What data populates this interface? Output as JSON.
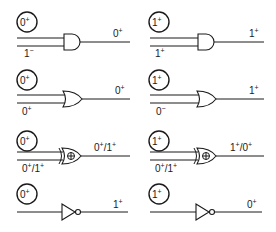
{
  "diagram": {
    "title": "",
    "panels": [
      {
        "id": "and-0",
        "gate": "AND",
        "control": "0",
        "control_sign": "+",
        "input_bottom": "1",
        "input_bottom_sign": "−",
        "output": "0",
        "output_sign": "+"
      },
      {
        "id": "and-1",
        "gate": "AND",
        "control": "1",
        "control_sign": "+",
        "input_bottom": "1",
        "input_bottom_sign": "+",
        "output": "1",
        "output_sign": "+"
      },
      {
        "id": "or-0",
        "gate": "OR",
        "control": "0",
        "control_sign": "+",
        "input_bottom": "0",
        "input_bottom_sign": "+",
        "output": "0",
        "output_sign": "+"
      },
      {
        "id": "or-1",
        "gate": "OR",
        "control": "1",
        "control_sign": "+",
        "input_bottom": "0",
        "input_bottom_sign": "−",
        "output": "1",
        "output_sign": "+"
      },
      {
        "id": "xor-0",
        "gate": "XOR",
        "control": "0",
        "control_sign": "+",
        "input_bottom_a": "0",
        "input_bottom_a_sign": "+",
        "input_bottom_sep": "/",
        "input_bottom_b": "1",
        "input_bottom_b_sign": "+",
        "output_a": "0",
        "output_a_sign": "+",
        "output_sep": "/",
        "output_b": "1",
        "output_b_sign": "+"
      },
      {
        "id": "xor-1",
        "gate": "XOR",
        "control": "1",
        "control_sign": "+",
        "input_bottom_a": "0",
        "input_bottom_a_sign": "+",
        "input_bottom_sep": "/",
        "input_bottom_b": "1",
        "input_bottom_b_sign": "+",
        "output_a": "1",
        "output_a_sign": "+",
        "output_sep": "/",
        "output_b": "0",
        "output_b_sign": "+"
      },
      {
        "id": "not-0",
        "gate": "NOT",
        "control": "0",
        "control_sign": "+",
        "output": "1",
        "output_sign": "+"
      },
      {
        "id": "not-1",
        "gate": "NOT",
        "control": "1",
        "control_sign": "+",
        "output": "0",
        "output_sign": "+"
      }
    ],
    "colors": {
      "ink": "#1a1a1a",
      "background": "#ffffff"
    }
  }
}
